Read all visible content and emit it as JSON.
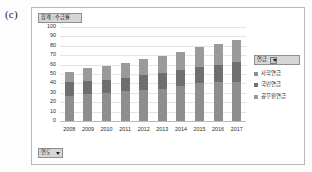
{
  "figure": {
    "panel_label": "(c)"
  },
  "chart": {
    "value_field_button": "합계 : 수급률",
    "row_field_button": "연도",
    "legend_field_button": "연금"
  },
  "icons": {
    "dropdown_caret": "filter-dropdown-icon"
  },
  "chart_data": {
    "type": "bar",
    "subtype": "stacked-column",
    "title": "합계 : 수급률",
    "xlabel": "연도",
    "ylabel": "",
    "categories": [
      "2008",
      "2009",
      "2010",
      "2011",
      "2012",
      "2013",
      "2014",
      "2015",
      "2016",
      "2017"
    ],
    "series": [
      {
        "name": "사학연금",
        "color": "#8e8e8e",
        "values": [
          27,
          29,
          30,
          32,
          33,
          34,
          37,
          40,
          41,
          42
        ]
      },
      {
        "name": "국민연금",
        "color": "#6f6f6f",
        "values": [
          15,
          14,
          14,
          14,
          16,
          17,
          17,
          18,
          19,
          21
        ]
      },
      {
        "name": "공무원연금",
        "color": "#9a9a9a",
        "values": [
          10,
          13,
          15,
          16,
          17,
          18,
          19,
          21,
          22,
          23
        ]
      }
    ],
    "totals": [
      52,
      56,
      59,
      62,
      66,
      69,
      73,
      79,
      82,
      86
    ],
    "yticks": [
      0,
      10,
      20,
      30,
      40,
      50,
      60,
      70,
      80,
      90,
      100
    ],
    "ylim": [
      0,
      100
    ],
    "grid": true,
    "legend_position": "right"
  }
}
